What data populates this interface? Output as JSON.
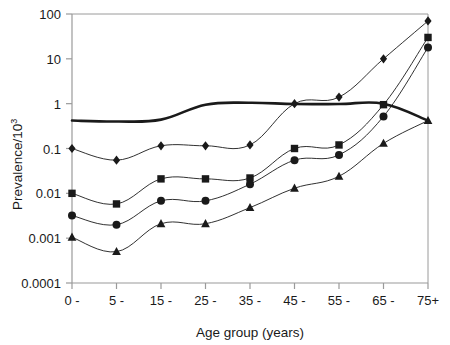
{
  "chart_data": {
    "type": "line",
    "title": "",
    "xlabel": "Age group (years)",
    "ylabel": "Prevalence/10",
    "ylabel_exponent": "3",
    "categories": [
      "0 -",
      "5 -",
      "15 -",
      "25 -",
      "35 -",
      "45 -",
      "55 -",
      "65 -",
      "75+"
    ],
    "x_index": [
      0,
      1,
      2,
      3,
      4,
      5,
      6,
      7,
      8
    ],
    "yscale": "log",
    "ylim": [
      0.0001,
      100
    ],
    "ytick_labels": [
      "100",
      "10",
      "1",
      "0.1",
      "0.01",
      "0.001",
      "0.0001"
    ],
    "ytick_values": [
      100,
      10,
      1,
      0.1,
      0.01,
      0.001,
      0.0001
    ],
    "grid": false,
    "legend": "none",
    "series": [
      {
        "name": "total",
        "marker": "none",
        "linewidth": 2.6,
        "color": "#1a1a1a",
        "values": [
          0.42,
          0.4,
          0.44,
          0.95,
          1.05,
          0.98,
          0.98,
          1.0,
          0.42
        ]
      },
      {
        "name": "diamond-series",
        "marker": "diamond",
        "linewidth": 0.9,
        "color": "#1a1a1a",
        "values": [
          0.1,
          0.055,
          0.115,
          0.115,
          0.12,
          1.0,
          1.4,
          10.0,
          70.0
        ]
      },
      {
        "name": "square-series",
        "marker": "square",
        "linewidth": 0.9,
        "color": "#1a1a1a",
        "values": [
          0.01,
          0.0058,
          0.021,
          0.021,
          0.022,
          0.1,
          0.12,
          0.95,
          30.0
        ]
      },
      {
        "name": "circle-series",
        "marker": "circle",
        "linewidth": 0.9,
        "color": "#1a1a1a",
        "values": [
          0.0032,
          0.002,
          0.0068,
          0.0068,
          0.016,
          0.055,
          0.072,
          0.52,
          18.0
        ]
      },
      {
        "name": "triangle-series",
        "marker": "triangle",
        "linewidth": 0.9,
        "color": "#1a1a1a",
        "values": [
          0.00105,
          0.0005,
          0.0021,
          0.0021,
          0.0048,
          0.013,
          0.024,
          0.13,
          0.42
        ]
      }
    ]
  },
  "axes": {
    "frame_color": "#9a9a9a",
    "background": "#ffffff"
  }
}
